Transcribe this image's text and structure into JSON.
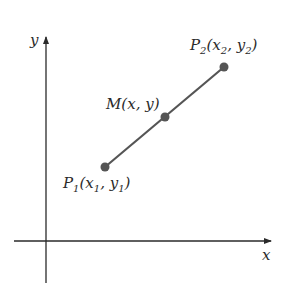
{
  "diagram": {
    "type": "coordinate-plane-midpoint",
    "axes": {
      "x_label": "x",
      "y_label": "y"
    },
    "points": [
      {
        "id": "P1",
        "label_main": "P",
        "label_sub": "1",
        "label_rest": "(x",
        "sub_x": "1",
        "comma": ", y",
        "sub_y": "1",
        "close": ")",
        "cx": 105,
        "cy": 167
      },
      {
        "id": "M",
        "label": "M(x, y)",
        "cx": 165,
        "cy": 117
      },
      {
        "id": "P2",
        "label_main": "P",
        "label_sub": "2",
        "label_rest": "(x",
        "sub_x": "2",
        "comma": ", y",
        "sub_y": "2",
        "close": ")",
        "cx": 224,
        "cy": 67
      }
    ],
    "colors": {
      "axis": "#2a2a2a",
      "segment": "#555555",
      "point": "#555555",
      "text": "#2a2a2a"
    }
  }
}
